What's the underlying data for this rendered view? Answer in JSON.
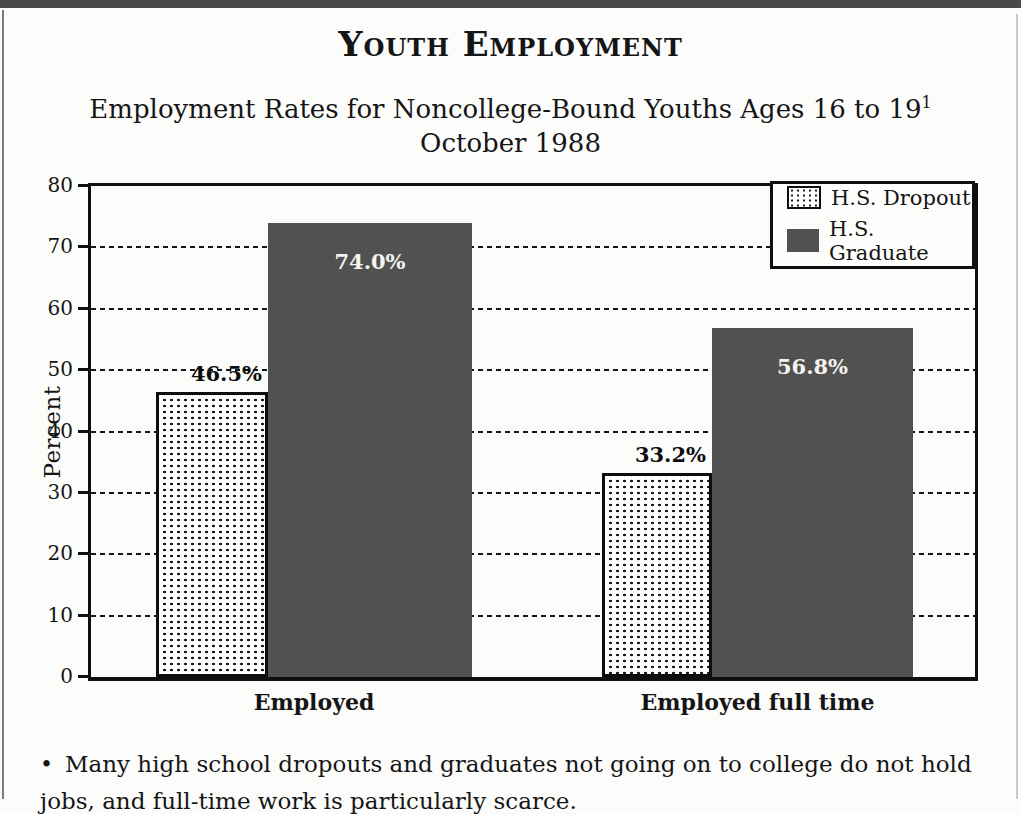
{
  "page": {
    "title": "Youth Employment",
    "subtitle_line1": "Employment Rates for Noncollege-Bound Youths Ages 16 to 19",
    "subtitle_superscript": "1",
    "subtitle_line2": "October 1988",
    "bullet": "•",
    "footnote_line1": "Many high school dropouts and graduates not going on to college do not hold",
    "footnote_line2": "jobs, and full-time work is particularly scarce."
  },
  "chart_data": {
    "type": "bar",
    "categories": [
      "Employed",
      "Employed full time"
    ],
    "series": [
      {
        "name": "H.S. Dropout",
        "style": "dotted-pattern",
        "values": [
          46.5,
          33.2
        ],
        "labels": [
          "46.5%",
          "33.2%"
        ]
      },
      {
        "name": "H.S. Graduate",
        "style": "solid-gray",
        "color": "#515151",
        "values": [
          74.0,
          56.8
        ],
        "labels": [
          "74.0%",
          "56.8%"
        ]
      }
    ],
    "ylabel": "Percent",
    "ylim": [
      0,
      80
    ],
    "yticks": [
      0,
      10,
      20,
      30,
      40,
      50,
      60,
      70,
      80
    ],
    "grid": "dashed-horizontal",
    "legend_position": "top-right",
    "colors": {
      "bar_gray": "#515151",
      "pattern_dot": "#1a1a1a",
      "frame": "#101010",
      "value_label_light": "#f4f3ee"
    }
  }
}
